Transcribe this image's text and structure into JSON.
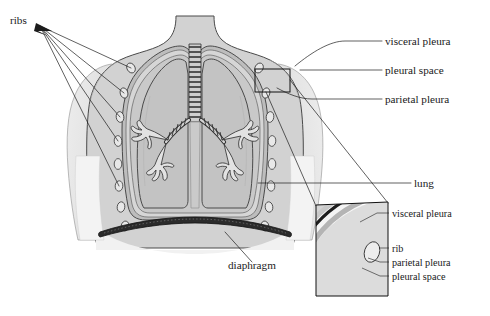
{
  "figure": {
    "title": "Pleural membranes of the lungs (anterior thoracic cross-section)",
    "labels": {
      "ribs": "ribs",
      "visceral_pleura": "visceral pleura",
      "pleural_space": "pleural space",
      "parietal_pleura": "parietal pleura",
      "lung": "lung",
      "diaphragm": "diaphragm",
      "inset_visceral_pleura": "visceral pleura",
      "inset_rib": "rib",
      "inset_parietal_pleura": "parietal pleura",
      "inset_pleural_space": "pleural space"
    },
    "callouts": [
      {
        "name": "ribs",
        "text": "ribs",
        "x": 10,
        "y": 24
      },
      {
        "name": "visceral-pleura",
        "text": "visceral pleura",
        "x": 385,
        "y": 44
      },
      {
        "name": "pleural-space",
        "text": "pleural space",
        "x": 385,
        "y": 73
      },
      {
        "name": "parietal-pleura",
        "text": "parietal pleura",
        "x": 385,
        "y": 102
      },
      {
        "name": "lung",
        "text": "lung",
        "x": 414,
        "y": 186
      },
      {
        "name": "diaphragm",
        "text": "diaphragm",
        "x": 228,
        "y": 269
      },
      {
        "name": "inset-visceral-pleura",
        "text": "visceral pleura",
        "x": 392,
        "y": 216
      },
      {
        "name": "inset-rib",
        "text": "rib",
        "x": 392,
        "y": 251
      },
      {
        "name": "inset-parietal-pleura",
        "text": "parietal pleura",
        "x": 392,
        "y": 265
      },
      {
        "name": "inset-pleural-space",
        "text": "pleural space",
        "x": 392,
        "y": 279
      }
    ],
    "colors": {
      "background": "#ffffff",
      "body_fill": "#d2d2d2",
      "arm_fill": "#e4e4e4",
      "shoulder_fill": "#cccccc",
      "lung_fill": "#c3c3c3",
      "pleural_cavity_fill": "#b9b9b9",
      "diaphragm_fill": "#2b2b2b",
      "trachea_fill": "#cfcfcf",
      "outline": "#3a3a3a",
      "text": "#1a1a1a",
      "leader": "#1c1c1c"
    },
    "rib_count_left": 8,
    "rib_count_right": 8
  }
}
